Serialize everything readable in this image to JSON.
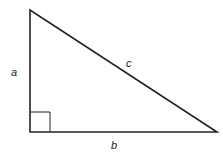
{
  "diagram": {
    "type": "right-triangle",
    "labels": {
      "a": "a",
      "b": "b",
      "c": "c"
    },
    "vertices": {
      "top": [
        30,
        10
      ],
      "right_angle": [
        30,
        132
      ],
      "right": [
        217,
        132
      ]
    },
    "right_angle_marker": true,
    "stroke_color": "#222222",
    "background": "#ffffff"
  }
}
